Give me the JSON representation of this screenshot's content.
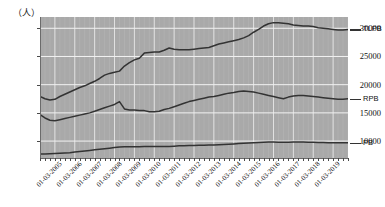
{
  "chart_data": {
    "type": "line",
    "title": "",
    "subtitle": "",
    "unit_label": "（人）",
    "xlabel": "",
    "ylabel": "",
    "ylim": [
      7000,
      32000
    ],
    "xlim": [
      "01-03-2004",
      "01-03-2020"
    ],
    "grid": true,
    "legend_position": "right-outside",
    "y_ticks": [
      10000,
      15000,
      20000,
      25000,
      30000
    ],
    "y_tick_labels": [
      "10000",
      "15000",
      "20000",
      "25000",
      "30000"
    ],
    "x_tick_labels": [
      "01-03-2005",
      "01-03-2006",
      "01-03-2007",
      "01-03-2008",
      "01-03-2009",
      "01-03-2010",
      "01-03-2011",
      "01-03-2012",
      "01-03-2013",
      "01-03-2014",
      "01-03-2015",
      "01-03-2016",
      "01-03-2017",
      "01-03-2018",
      "01-03-2019"
    ],
    "x_minor_ticks_per_label": 4,
    "series": [
      {
        "name": "TLPB",
        "color": "#333333",
        "x": [
          "2004-06",
          "2004-09",
          "2004-12",
          "2005-03",
          "2005-06",
          "2005-09",
          "2005-12",
          "2006-03",
          "2006-06",
          "2006-09",
          "2006-12",
          "2007-03",
          "2007-06",
          "2007-09",
          "2007-12",
          "2008-03",
          "2008-06",
          "2008-09",
          "2008-12",
          "2009-03",
          "2009-06",
          "2009-09",
          "2009-12",
          "2010-03",
          "2010-06",
          "2010-09",
          "2010-12",
          "2011-03",
          "2011-06",
          "2011-09",
          "2011-12",
          "2012-03",
          "2012-06",
          "2012-09",
          "2012-12",
          "2013-03",
          "2013-06",
          "2013-09",
          "2013-12",
          "2014-03",
          "2014-06",
          "2014-09",
          "2014-12",
          "2015-03",
          "2015-06",
          "2015-09",
          "2015-12",
          "2016-03",
          "2016-06",
          "2016-09",
          "2016-12",
          "2017-03",
          "2017-06",
          "2017-09",
          "2017-12",
          "2018-03",
          "2018-06",
          "2018-09",
          "2018-12",
          "2019-03",
          "2019-06",
          "2019-09",
          "2019-12"
        ],
        "values": [
          17900,
          17500,
          17300,
          17400,
          17900,
          18300,
          18700,
          19100,
          19500,
          19800,
          20200,
          20600,
          21100,
          21700,
          22000,
          22200,
          22400,
          23300,
          23900,
          24400,
          24700,
          25600,
          25700,
          25800,
          25800,
          26100,
          26500,
          26300,
          26200,
          26200,
          26200,
          26300,
          26400,
          26500,
          26600,
          26900,
          27200,
          27400,
          27600,
          27800,
          28000,
          28300,
          28700,
          29300,
          29800,
          30400,
          30800,
          31000,
          31000,
          30900,
          30800,
          30600,
          30500,
          30400,
          30400,
          30300,
          30100,
          30000,
          29900,
          29800,
          29700,
          29700,
          29800
        ]
      },
      {
        "name": "RPB",
        "color": "#333333",
        "x": [
          "2004-06",
          "2004-09",
          "2004-12",
          "2005-03",
          "2005-06",
          "2005-09",
          "2005-12",
          "2006-03",
          "2006-06",
          "2006-09",
          "2006-12",
          "2007-03",
          "2007-06",
          "2007-09",
          "2007-12",
          "2008-03",
          "2008-06",
          "2008-09",
          "2008-12",
          "2009-03",
          "2009-06",
          "2009-09",
          "2009-12",
          "2010-03",
          "2010-06",
          "2010-09",
          "2010-12",
          "2011-03",
          "2011-06",
          "2011-09",
          "2011-12",
          "2012-03",
          "2012-06",
          "2012-09",
          "2012-12",
          "2013-03",
          "2013-06",
          "2013-09",
          "2013-12",
          "2014-03",
          "2014-06",
          "2014-09",
          "2014-12",
          "2015-03",
          "2015-06",
          "2015-09",
          "2015-12",
          "2016-03",
          "2016-06",
          "2016-09",
          "2016-12",
          "2017-03",
          "2017-06",
          "2017-09",
          "2017-12",
          "2018-03",
          "2018-06",
          "2018-09",
          "2018-12",
          "2019-03",
          "2019-06",
          "2019-09",
          "2019-12"
        ],
        "values": [
          14700,
          14100,
          13700,
          13600,
          13800,
          14000,
          14200,
          14400,
          14600,
          14800,
          15000,
          15300,
          15600,
          15900,
          16200,
          16500,
          17000,
          15700,
          15500,
          15500,
          15400,
          15400,
          15200,
          15200,
          15300,
          15600,
          15800,
          16100,
          16400,
          16700,
          17000,
          17200,
          17400,
          17600,
          17800,
          17900,
          18100,
          18300,
          18500,
          18600,
          18800,
          18900,
          18800,
          18700,
          18500,
          18300,
          18100,
          17900,
          17700,
          17500,
          17800,
          18000,
          18100,
          18100,
          18000,
          17900,
          17800,
          17700,
          17600,
          17500,
          17400,
          17400,
          17500
        ]
      },
      {
        "name": "PB",
        "color": "#333333",
        "x": [
          "2004-06",
          "2004-09",
          "2004-12",
          "2005-03",
          "2005-06",
          "2005-09",
          "2005-12",
          "2006-03",
          "2006-06",
          "2006-09",
          "2006-12",
          "2007-03",
          "2007-06",
          "2007-09",
          "2007-12",
          "2008-03",
          "2008-06",
          "2008-09",
          "2008-12",
          "2009-03",
          "2009-06",
          "2009-09",
          "2009-12",
          "2010-03",
          "2010-06",
          "2010-09",
          "2010-12",
          "2011-03",
          "2011-06",
          "2011-09",
          "2011-12",
          "2012-03",
          "2012-06",
          "2012-09",
          "2012-12",
          "2013-03",
          "2013-06",
          "2013-09",
          "2013-12",
          "2014-03",
          "2014-06",
          "2014-09",
          "2014-12",
          "2015-03",
          "2015-06",
          "2015-09",
          "2015-12",
          "2016-03",
          "2016-06",
          "2016-09",
          "2016-12",
          "2017-03",
          "2017-06",
          "2017-09",
          "2017-12",
          "2018-03",
          "2018-06",
          "2018-09",
          "2018-12",
          "2019-03",
          "2019-06",
          "2019-09",
          "2019-12"
        ],
        "values": [
          7700,
          7700,
          7750,
          7800,
          7850,
          7900,
          7950,
          8050,
          8150,
          8250,
          8350,
          8450,
          8550,
          8650,
          8750,
          8850,
          8950,
          9000,
          9000,
          9000,
          9000,
          9050,
          9050,
          9050,
          9050,
          9050,
          9050,
          9100,
          9150,
          9150,
          9200,
          9200,
          9250,
          9250,
          9300,
          9300,
          9350,
          9400,
          9450,
          9500,
          9550,
          9600,
          9650,
          9700,
          9750,
          9800,
          9850,
          9850,
          9800,
          9800,
          9800,
          9850,
          9850,
          9850,
          9800,
          9800,
          9750,
          9750,
          9700,
          9700,
          9700,
          9700,
          9700
        ]
      }
    ]
  },
  "legend": {
    "items": [
      {
        "label": "TLPB"
      },
      {
        "label": "RPB"
      },
      {
        "label": "PB"
      }
    ]
  },
  "colors": {
    "plot_background": "#a9a9a9",
    "gridline_major": "#f2f2f2",
    "gridline_minor": "#bdbdbd",
    "series_line": "#333333",
    "axis": "#6b6b6b",
    "text": "#111111"
  }
}
